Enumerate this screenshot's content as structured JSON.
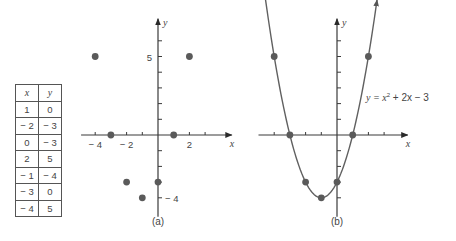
{
  "table": {
    "headers": [
      "x",
      "y"
    ],
    "rows": [
      [
        1,
        0
      ],
      [
        -2,
        -3
      ],
      [
        0,
        -3
      ],
      [
        2,
        5
      ],
      [
        -1,
        -4
      ],
      [
        -3,
        0
      ],
      [
        -4,
        5
      ]
    ],
    "display_rows": [
      [
        "1",
        "0"
      ],
      [
        "− 2",
        "− 3"
      ],
      [
        "0",
        "− 3"
      ],
      [
        "2",
        "5"
      ],
      [
        "− 1",
        "− 4"
      ],
      [
        "− 3",
        "0"
      ],
      [
        "− 4",
        "5"
      ]
    ]
  },
  "chart_data": [
    {
      "type": "scatter",
      "title": "(a)",
      "xlabel": "x",
      "ylabel": "y",
      "x": [
        1,
        -2,
        0,
        2,
        -1,
        -3,
        -4
      ],
      "y": [
        0,
        -3,
        -3,
        5,
        -4,
        0,
        5
      ],
      "xlim": [
        -5,
        4.8
      ],
      "ylim": [
        -5,
        7.5
      ],
      "x_tick_labels": [
        {
          "value": -4,
          "label": "− 4"
        },
        {
          "value": -2,
          "label": "− 2"
        },
        {
          "value": 2,
          "label": "2"
        }
      ],
      "y_tick_labels": [
        {
          "value": 5,
          "label": "5"
        },
        {
          "value": -4,
          "label": "− 4"
        }
      ],
      "grid": false
    },
    {
      "type": "line",
      "title": "(b)",
      "xlabel": "x",
      "ylabel": "y",
      "equation": "y = x² + 2x − 3",
      "function": {
        "a": 1,
        "b": 2,
        "c": -3
      },
      "points": {
        "x": [
          -4,
          -3,
          -2,
          -1,
          0,
          1,
          2
        ],
        "y": [
          5,
          0,
          -3,
          -4,
          -3,
          0,
          5
        ]
      },
      "xlim": [
        -5,
        4.5
      ],
      "ylim": [
        -5,
        7.5
      ],
      "grid": false
    }
  ],
  "labels": {
    "panel_a": "(a)",
    "panel_b": "(b)",
    "x_axis": "x",
    "y_axis": "y",
    "equation_lhs": "y",
    "equation_rest": " = x",
    "equation_exp": "2",
    "equation_tail": " + 2x − 3"
  },
  "colors": {
    "axis": "#3a3a3a",
    "point": "#5a5a5a",
    "curve": "#606060",
    "text": "#444444"
  }
}
